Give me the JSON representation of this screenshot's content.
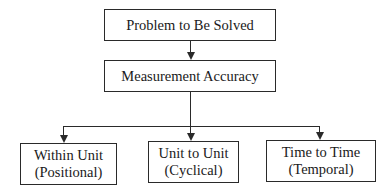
{
  "diagram": {
    "type": "hierarchy-flowchart",
    "nodes": {
      "root": {
        "label": "Problem to Be Solved"
      },
      "middle": {
        "label": "Measurement Accuracy"
      },
      "children": [
        {
          "line1": "Within Unit",
          "line2": "(Positional)"
        },
        {
          "line1": "Unit to Unit",
          "line2": "(Cyclical)"
        },
        {
          "line1": "Time to Time",
          "line2": "(Temporal)"
        }
      ]
    },
    "edges": [
      [
        "Problem to Be Solved",
        "Measurement Accuracy"
      ],
      [
        "Measurement Accuracy",
        "Within Unit (Positional)"
      ],
      [
        "Measurement Accuracy",
        "Unit to Unit (Cyclical)"
      ],
      [
        "Measurement Accuracy",
        "Time to Time (Temporal)"
      ]
    ],
    "colors": {
      "stroke": "#2a2a2a",
      "background": "#ffffff",
      "text": "#1a1a1a"
    }
  }
}
